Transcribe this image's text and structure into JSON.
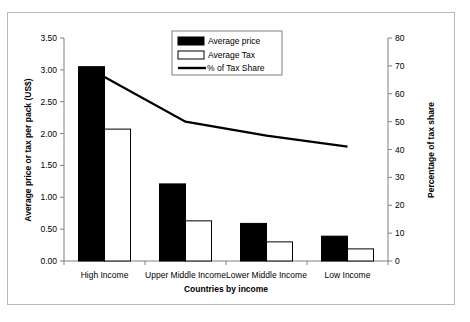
{
  "chart_data": {
    "type": "bar",
    "title": "",
    "xlabel": "Countries by income",
    "ylabel": "Average price or tax per pack (US$)",
    "y2label": "Percentage of tax share",
    "categories": [
      "High Income",
      "Upper Middle Income",
      "Lower Middle Income",
      "Low Income"
    ],
    "series": [
      {
        "name": "Average price",
        "type": "bar",
        "axis": "left",
        "color": "#000000",
        "values": [
          3.05,
          1.21,
          0.59,
          0.39
        ]
      },
      {
        "name": "Average Tax",
        "type": "bar",
        "axis": "left",
        "color": "#ffffff",
        "values": [
          2.07,
          0.63,
          0.3,
          0.19
        ]
      },
      {
        "name": "% of Tax Share",
        "type": "line",
        "axis": "right",
        "color": "#000000",
        "values": [
          66,
          50,
          45,
          41
        ]
      }
    ],
    "ylim": [
      0,
      3.5
    ],
    "yticks": [
      "0.00",
      "0.50",
      "1.00",
      "1.50",
      "2.00",
      "2.50",
      "3.00",
      "3.50"
    ],
    "y2lim": [
      0,
      80
    ],
    "y2ticks": [
      "0",
      "10",
      "20",
      "30",
      "40",
      "50",
      "60",
      "70",
      "80"
    ],
    "grid": false,
    "legend_position": "top-center",
    "legend": [
      "Average price",
      "Average Tax",
      "% of Tax Share"
    ]
  },
  "axes": {
    "left_title": "Average price or tax per pack (US$)",
    "right_title": "Percentage of tax share",
    "bottom_title": "Countries by income"
  }
}
